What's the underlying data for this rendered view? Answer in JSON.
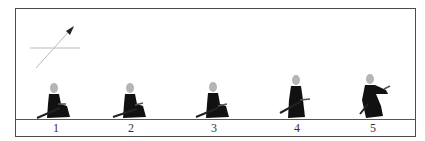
{
  "diagram": {
    "frames": [
      {
        "label": "1",
        "x": 55
      },
      {
        "label": "2",
        "x": 130
      },
      {
        "label": "3",
        "x": 213
      },
      {
        "label": "4",
        "x": 296
      },
      {
        "label": "5",
        "x": 372
      }
    ],
    "colors": {
      "figure": "#111111",
      "head": "#b5b5b5",
      "frame": "#4a4a4a",
      "arrow_line": "#aaaaaa"
    }
  }
}
